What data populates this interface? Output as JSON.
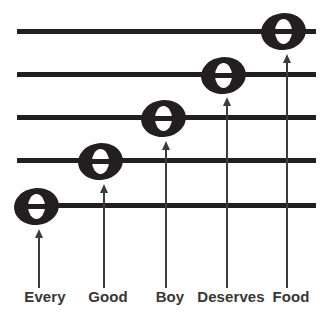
{
  "diagram": {
    "mnemonic": "Every Good Boy Deserves Food",
    "colors": {
      "ink": "#231f20",
      "arrow": "#3f3a3b",
      "label": "#3a3536",
      "background": "#ffffff",
      "note_hole": "#ffffff"
    },
    "staff": {
      "line_count": 5,
      "line_left": 17,
      "line_right": 316,
      "line_thickness": 5,
      "lines": [
        {
          "index": 1,
          "position_from_top": 1,
          "y": 31,
          "note_label": "Food"
        },
        {
          "index": 2,
          "position_from_top": 2,
          "y": 74,
          "note_label": "Deserves"
        },
        {
          "index": 3,
          "position_from_top": 3,
          "y": 117,
          "note_label": "Boy"
        },
        {
          "index": 4,
          "position_from_top": 4,
          "y": 160,
          "note_label": "Good"
        },
        {
          "index": 5,
          "position_from_top": 5,
          "y": 205,
          "note_label": "Every"
        }
      ]
    },
    "notes": [
      {
        "label": "Every",
        "icon": "whole-note-icon",
        "cx": 36,
        "cy": 206,
        "staff_line": 5
      },
      {
        "label": "Good",
        "icon": "whole-note-icon",
        "cx": 100,
        "cy": 161,
        "staff_line": 4
      },
      {
        "label": "Boy",
        "icon": "whole-note-icon",
        "cx": 163,
        "cy": 118,
        "staff_line": 3
      },
      {
        "label": "Deserves",
        "icon": "whole-note-icon",
        "cx": 223,
        "cy": 75,
        "staff_line": 2
      },
      {
        "label": "Food",
        "icon": "whole-note-icon",
        "cx": 283,
        "cy": 31,
        "staff_line": 1
      }
    ],
    "arrows": [
      {
        "icon": "up-arrow-icon",
        "for_label": "Every",
        "x": 39,
        "tip_y": 230,
        "base_y": 288
      },
      {
        "icon": "up-arrow-icon",
        "for_label": "Good",
        "x": 104,
        "tip_y": 185,
        "base_y": 288
      },
      {
        "icon": "up-arrow-icon",
        "for_label": "Boy",
        "x": 166,
        "tip_y": 142,
        "base_y": 288
      },
      {
        "icon": "up-arrow-icon",
        "for_label": "Deserves",
        "x": 227,
        "tip_y": 98,
        "base_y": 288
      },
      {
        "icon": "up-arrow-icon",
        "for_label": "Food",
        "x": 287,
        "tip_y": 55,
        "base_y": 288
      }
    ],
    "labels": [
      {
        "text": "Every",
        "cx": 45,
        "y": 288
      },
      {
        "text": "Good",
        "cx": 108,
        "y": 288
      },
      {
        "text": "Boy",
        "cx": 170,
        "y": 288
      },
      {
        "text": "Deserves",
        "cx": 231,
        "y": 288
      },
      {
        "text": "Food",
        "cx": 291,
        "y": 288
      }
    ]
  }
}
